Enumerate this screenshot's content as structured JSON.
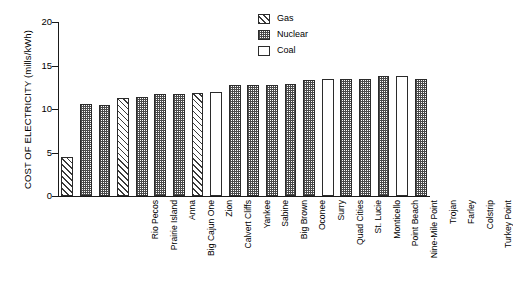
{
  "chart_data": {
    "type": "bar",
    "title": "",
    "xlabel": "",
    "ylabel": "COST OF ELECTRICITY (mills/kWh)",
    "ylim": [
      0,
      20
    ],
    "yticks": [
      0,
      5,
      10,
      15,
      20
    ],
    "grid": false,
    "legend_position": "top-right",
    "legend": [
      {
        "label": "Gas",
        "pattern": "diagonal-hatch"
      },
      {
        "label": "Nuclear",
        "pattern": "stipple"
      },
      {
        "label": "Coal",
        "pattern": "white"
      }
    ],
    "categories": [
      "Rio Pecos",
      "Prairie Island",
      "Anna",
      "Big Cajun One",
      "Zion",
      "Calvert Cliffs",
      "Yankee",
      "Sabine",
      "Big Brown",
      "Oconee",
      "Surry",
      "Quad Cities",
      "St. Lucie",
      "Monticello",
      "Point Beach",
      "Nine-Mile Point",
      "Trojan",
      "Farley",
      "Colstrip",
      "Turkey Point"
    ],
    "values": [
      4.5,
      10.6,
      10.5,
      11.3,
      11.4,
      11.7,
      11.7,
      11.8,
      12.0,
      12.8,
      12.8,
      12.8,
      12.9,
      13.3,
      13.4,
      13.4,
      13.5,
      13.8,
      13.8,
      13.5
    ],
    "fuels": [
      "gas",
      "nuclear",
      "nuclear",
      "gas",
      "nuclear",
      "nuclear",
      "nuclear",
      "gas",
      "coal",
      "nuclear",
      "nuclear",
      "nuclear",
      "nuclear",
      "nuclear",
      "coal",
      "nuclear",
      "nuclear",
      "nuclear",
      "coal",
      "nuclear"
    ]
  }
}
